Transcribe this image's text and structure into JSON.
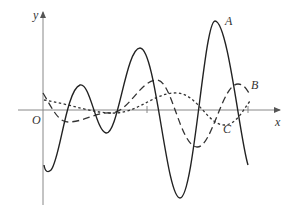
{
  "diagram": {
    "type": "graph-of-three-curves",
    "axes": {
      "x_label": "x",
      "y_label": "y",
      "origin_label": "O",
      "color": "#888888"
    },
    "curves": [
      {
        "label": "A",
        "style": "solid",
        "color": "#222222",
        "description": "large-amplitude oscillation with growing amplitude"
      },
      {
        "label": "B",
        "style": "long-dashed",
        "color": "#333333",
        "description": "medium-amplitude oscillation"
      },
      {
        "label": "C",
        "style": "short-dashed (dotted)",
        "color": "#333333",
        "description": "small-amplitude slow oscillation"
      }
    ]
  }
}
